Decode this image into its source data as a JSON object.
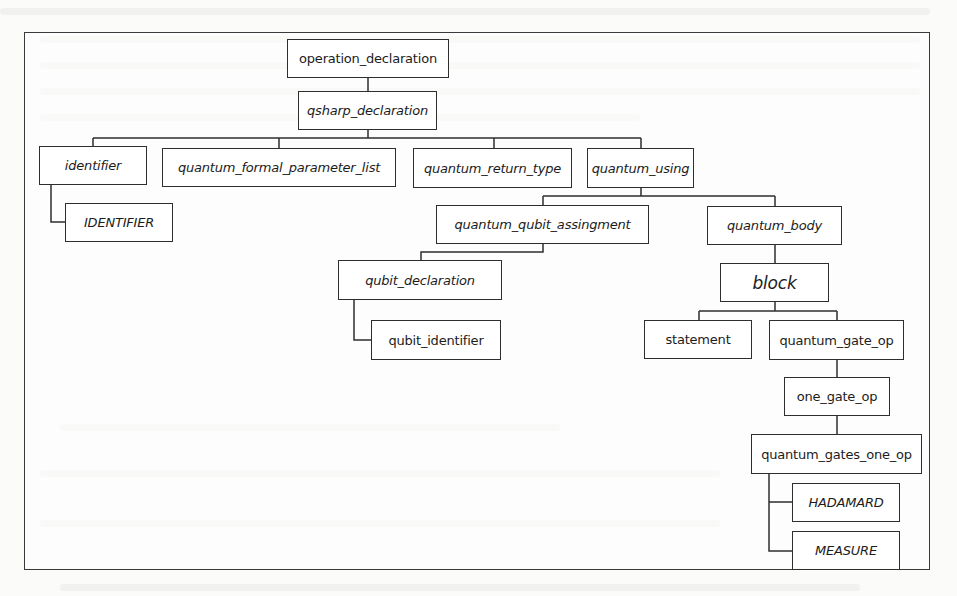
{
  "diagram": {
    "type": "parse-tree",
    "root": "operation_declaration",
    "nodes": [
      {
        "id": "operation_declaration",
        "label": "operation_declaration",
        "italic": false
      },
      {
        "id": "qsharp_declaration",
        "label": "qsharp_declaration",
        "italic": true
      },
      {
        "id": "identifier",
        "label": "identifier",
        "italic": true
      },
      {
        "id": "IDENTIFIER",
        "label": "IDENTIFIER",
        "italic": true
      },
      {
        "id": "quantum_formal_parameter_list",
        "label": "quantum_formal_parameter_list",
        "italic": true
      },
      {
        "id": "quantum_return_type",
        "label": "quantum_return_type",
        "italic": true
      },
      {
        "id": "quantum_using",
        "label": "quantum_using",
        "italic": true
      },
      {
        "id": "quantum_qubit_assingment",
        "label": "quantum_qubit_assingment",
        "italic": true
      },
      {
        "id": "qubit_declaration",
        "label": "qubit_declaration",
        "italic": true
      },
      {
        "id": "qubit_identifier",
        "label": "qubit_identifier",
        "italic": false
      },
      {
        "id": "quantum_body",
        "label": "quantum_body",
        "italic": true
      },
      {
        "id": "block",
        "label": "block",
        "italic": true
      },
      {
        "id": "statement",
        "label": "statement",
        "italic": false
      },
      {
        "id": "quantum_gate_op",
        "label": "quantum_gate_op",
        "italic": false
      },
      {
        "id": "one_gate_op",
        "label": "one_gate_op",
        "italic": false
      },
      {
        "id": "quantum_gates_one_op",
        "label": "quantum_gates_one_op",
        "italic": false
      },
      {
        "id": "HADAMARD",
        "label": "HADAMARD",
        "italic": true
      },
      {
        "id": "MEASURE",
        "label": "MEASURE",
        "italic": true
      }
    ],
    "edges": [
      [
        "operation_declaration",
        "qsharp_declaration"
      ],
      [
        "qsharp_declaration",
        "identifier"
      ],
      [
        "qsharp_declaration",
        "quantum_formal_parameter_list"
      ],
      [
        "qsharp_declaration",
        "quantum_return_type"
      ],
      [
        "qsharp_declaration",
        "quantum_using"
      ],
      [
        "identifier",
        "IDENTIFIER"
      ],
      [
        "quantum_using",
        "quantum_qubit_assingment"
      ],
      [
        "quantum_using",
        "quantum_body"
      ],
      [
        "quantum_qubit_assingment",
        "qubit_declaration"
      ],
      [
        "qubit_declaration",
        "qubit_identifier"
      ],
      [
        "quantum_body",
        "block"
      ],
      [
        "block",
        "statement"
      ],
      [
        "block",
        "quantum_gate_op"
      ],
      [
        "quantum_gate_op",
        "one_gate_op"
      ],
      [
        "one_gate_op",
        "quantum_gates_one_op"
      ],
      [
        "quantum_gates_one_op",
        "HADAMARD"
      ],
      [
        "quantum_gates_one_op",
        "MEASURE"
      ]
    ]
  }
}
